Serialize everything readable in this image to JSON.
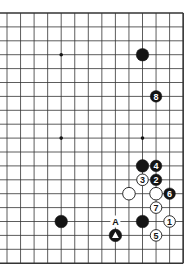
{
  "diagram": {
    "type": "go-board-partial",
    "board_size": 19,
    "visible_columns": 14,
    "visible_rows": 19,
    "edges": {
      "top": true,
      "bottom": true,
      "right": true,
      "left": false
    },
    "grid": {
      "x0": 7,
      "dx": 13.55,
      "y0": 13,
      "dy": 13.9
    },
    "colors": {
      "line": "#333333",
      "black": "#141414",
      "white": "#ffffff",
      "background": "#ffffff"
    },
    "star_points": [
      {
        "col": 4,
        "row": 3
      },
      {
        "col": 4,
        "row": 9
      },
      {
        "col": 10,
        "row": 9
      }
    ],
    "stones": [
      {
        "color": "black",
        "col": 10,
        "row": 3,
        "label": ""
      },
      {
        "color": "black",
        "col": 11,
        "row": 6,
        "label": "8"
      },
      {
        "color": "black",
        "col": 10,
        "row": 11,
        "label": ""
      },
      {
        "color": "black",
        "col": 11,
        "row": 11,
        "label": "4"
      },
      {
        "color": "white",
        "col": 10,
        "row": 12,
        "label": "3"
      },
      {
        "color": "black",
        "col": 11,
        "row": 12,
        "label": "2"
      },
      {
        "color": "white",
        "col": 9,
        "row": 13,
        "label": ""
      },
      {
        "color": "white",
        "col": 11,
        "row": 13,
        "label": ""
      },
      {
        "color": "black",
        "col": 12,
        "row": 13,
        "label": "6"
      },
      {
        "color": "white",
        "col": 11,
        "row": 14,
        "label": "7"
      },
      {
        "color": "black",
        "col": 4,
        "row": 15,
        "label": ""
      },
      {
        "color": "black",
        "col": 10,
        "row": 15,
        "label": ""
      },
      {
        "color": "white",
        "col": 12,
        "row": 15,
        "label": "1"
      },
      {
        "color": "black",
        "col": 8,
        "row": 16,
        "label": "",
        "marker": "triangle"
      },
      {
        "color": "white",
        "col": 11,
        "row": 16,
        "label": "5"
      }
    ],
    "letters": [
      {
        "col": 8,
        "row": 15,
        "text": "A"
      }
    ]
  }
}
